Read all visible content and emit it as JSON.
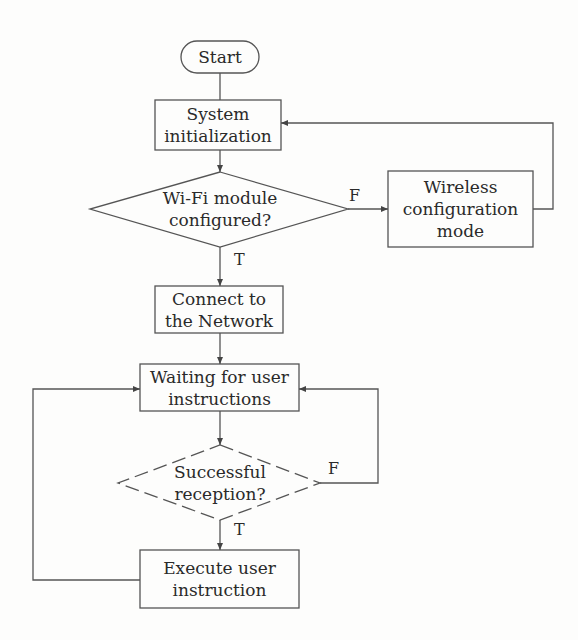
{
  "diagram": {
    "type": "flowchart",
    "nodes": {
      "start": {
        "shape": "terminal",
        "lines": [
          "Start"
        ]
      },
      "system_init": {
        "shape": "process",
        "lines": [
          "System",
          "initialization"
        ]
      },
      "wifi_check": {
        "shape": "decision",
        "lines": [
          "Wi-Fi module",
          "configured?"
        ]
      },
      "wireless_config": {
        "shape": "process",
        "lines": [
          "Wireless",
          "configuration",
          "mode"
        ]
      },
      "connect": {
        "shape": "process",
        "lines": [
          "Connect to",
          "the Network"
        ]
      },
      "waiting": {
        "shape": "process",
        "lines": [
          "Waiting for user",
          "instructions"
        ]
      },
      "reception_check": {
        "shape": "decision",
        "lines": [
          "Successful",
          "reception?"
        ]
      },
      "execute": {
        "shape": "process",
        "lines": [
          "Execute user",
          "instruction"
        ]
      }
    },
    "edge_labels": {
      "wifi_false": "F",
      "wifi_true": "T",
      "reception_false": "F",
      "reception_true": "T"
    },
    "edges": [
      {
        "from": "start",
        "to": "system_init"
      },
      {
        "from": "system_init",
        "to": "wifi_check"
      },
      {
        "from": "wifi_check",
        "to": "wireless_config",
        "label": "F"
      },
      {
        "from": "wireless_config",
        "to": "system_init"
      },
      {
        "from": "wifi_check",
        "to": "connect",
        "label": "T"
      },
      {
        "from": "connect",
        "to": "waiting"
      },
      {
        "from": "waiting",
        "to": "reception_check"
      },
      {
        "from": "reception_check",
        "to": "waiting",
        "label": "F"
      },
      {
        "from": "reception_check",
        "to": "execute",
        "label": "T"
      },
      {
        "from": "execute",
        "to": "waiting"
      }
    ],
    "colors": {
      "stroke": "#555555",
      "text": "#2a2a2a",
      "background": "#fdfdfc"
    }
  }
}
